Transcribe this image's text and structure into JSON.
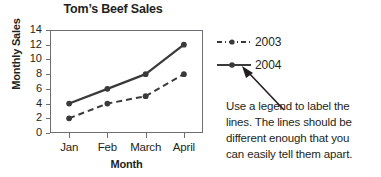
{
  "chart_data": {
    "type": "line",
    "title": "Tom’s Beef Sales",
    "xlabel": "Month",
    "ylabel": "Monthly Sales",
    "categories": [
      "Jan",
      "Feb",
      "March",
      "April"
    ],
    "ylim": [
      0,
      14
    ],
    "yticks": [
      0,
      2,
      4,
      6,
      8,
      10,
      12,
      14
    ],
    "ytick_labels": [
      "0",
      "2",
      "4",
      "6",
      "8",
      "10",
      "12",
      "14"
    ],
    "grid": false,
    "legend_position": "right",
    "series": [
      {
        "name": "2003",
        "values": [
          2,
          4,
          5,
          8
        ],
        "style": "dashed",
        "color": "#3a3a3a",
        "marker": "circle"
      },
      {
        "name": "2004",
        "values": [
          4,
          6,
          8,
          12
        ],
        "style": "solid",
        "color": "#3a3a3a",
        "marker": "circle"
      }
    ]
  },
  "legend": {
    "items": [
      {
        "label": "2003",
        "style": "dashed"
      },
      {
        "label": "2004",
        "style": "solid"
      }
    ]
  },
  "annotation": {
    "lines": [
      "Use a legend to label the",
      "lines. The lines should be",
      "different enough that you",
      "can easily tell them apart."
    ]
  },
  "colors": {
    "line": "#3a3a3a",
    "frame": "#6d6e71",
    "text": "#231f20",
    "background": "#ffffff"
  }
}
